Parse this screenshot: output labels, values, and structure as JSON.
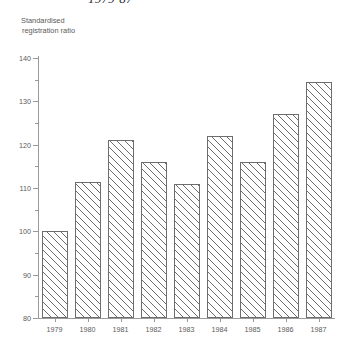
{
  "chart_data": {
    "type": "bar",
    "title": "1979-87",
    "subtitle": "",
    "xlabel": "",
    "ylabel": "Standardised registration ratio",
    "ylabel_lines": [
      "Standardised",
      "registration ratio"
    ],
    "categories": [
      "1979",
      "1980",
      "1981",
      "1982",
      "1983",
      "1984",
      "1985",
      "1986",
      "1987"
    ],
    "values": [
      100,
      111.5,
      121,
      116,
      111,
      122,
      116,
      127,
      134.5
    ],
    "ylim": [
      80,
      140
    ],
    "ytick_labels": [
      "80",
      "90",
      "100",
      "110",
      "120",
      "130",
      "140"
    ],
    "ytick_values": [
      80,
      90,
      100,
      110,
      120,
      130,
      140
    ],
    "yminor_values": [
      85,
      95,
      105,
      115,
      125,
      135
    ],
    "grid": false,
    "legend": null,
    "bar_style": "diagonal-hatch",
    "colors": {
      "bar_edge": "#6d6d6d",
      "bar_fill": "#ffffff",
      "hatch": "#6d6d6d",
      "axis": "#9a9a9a",
      "text": "#5a5a5a",
      "title": "#2b2b2b",
      "background": "#ffffff"
    }
  }
}
